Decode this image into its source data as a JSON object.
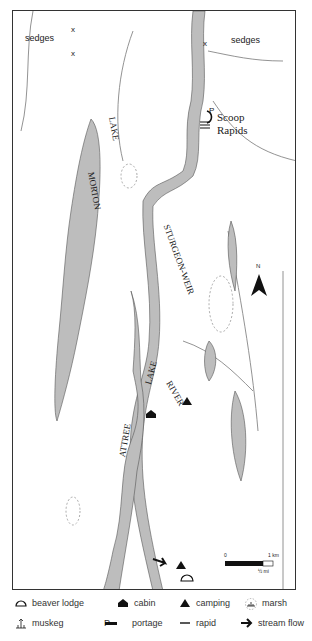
{
  "map": {
    "lake_labels": [
      "MORTON",
      "LAKE",
      "STURGEON-WEIR",
      "LAKE",
      "RIVER",
      "ATTREE"
    ],
    "place_labels": {
      "scoop": "Scoop",
      "rapids": "Rapids",
      "sedges_left": "sedges",
      "sedges_right": "sedges",
      "portage_marker": "P",
      "sedge_marker": "x"
    },
    "north_label": "N",
    "scale": {
      "zero": "0",
      "km": "1 km",
      "mi": "½ mi"
    },
    "colors": {
      "water": "#bdbdbd",
      "outline": "#555555",
      "frame": "#333333"
    }
  },
  "legend": {
    "items": [
      {
        "icon": "beaver-lodge-icon",
        "label": "beaver lodge"
      },
      {
        "icon": "cabin-icon",
        "label": "cabin"
      },
      {
        "icon": "camping-icon",
        "label": "camping"
      },
      {
        "icon": "marsh-icon",
        "label": "marsh"
      },
      {
        "icon": "muskeg-icon",
        "label": "muskeg"
      },
      {
        "icon": "portage-icon",
        "label": "portage",
        "prefix": "P"
      },
      {
        "icon": "rapid-icon",
        "label": "rapid"
      },
      {
        "icon": "stream-flow-icon",
        "label": "stream flow"
      }
    ]
  }
}
